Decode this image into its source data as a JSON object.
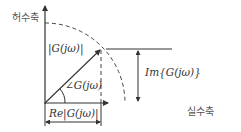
{
  "diagram": {
    "axes": {
      "imaginary_axis_label": "허수축",
      "real_axis_label": "실수축"
    },
    "labels": {
      "magnitude": "|G(jω)|",
      "angle": "∠G(jω)",
      "imaginary_part": "Im{G(jω)}",
      "real_part": "Re|G(jω)|"
    },
    "colors": {
      "line": "#333333",
      "text": "#444444",
      "background": "#ffffff"
    }
  }
}
